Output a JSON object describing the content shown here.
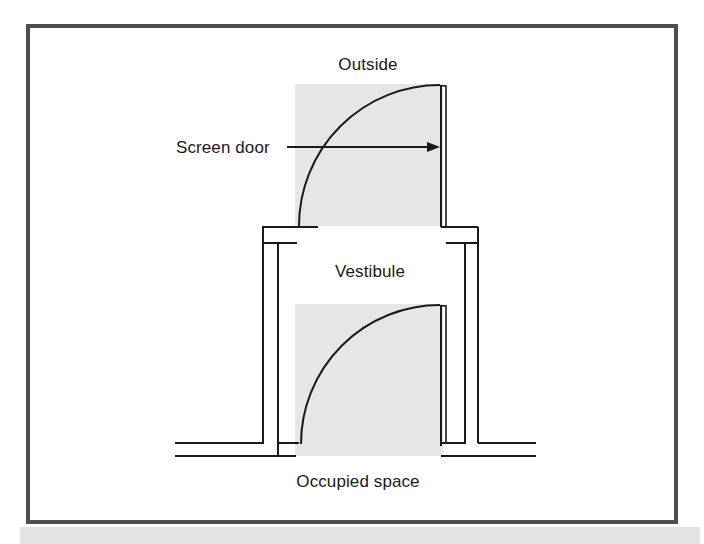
{
  "figure": {
    "type": "architectural-plan",
    "frame": {
      "border_color": "#4d4d4d",
      "border_width_px": 4,
      "x": 26,
      "y": 24,
      "width": 652,
      "height": 500,
      "background": "#ffffff"
    },
    "bottom_band": {
      "color": "#e3e3e3",
      "x": 20,
      "y": 527,
      "width": 680,
      "height": 17
    },
    "colors": {
      "shade_fill": "#e6e6e6",
      "line": "#1a1a1a",
      "text": "#1a1a1a",
      "frame": "#4d4d4d",
      "page": "#ffffff"
    },
    "labels": {
      "outside": "Outside",
      "screen_door": "Screen door",
      "vestibule": "Vestibule",
      "occupied_space": "Occupied space"
    },
    "label_positions": {
      "outside": {
        "x": 368,
        "y": 70,
        "anchor": "middle"
      },
      "screen_door": {
        "x": 176,
        "y": 153,
        "anchor": "start"
      },
      "vestibule": {
        "x": 370,
        "y": 277,
        "anchor": "middle"
      },
      "occupied_space": {
        "x": 358,
        "y": 487,
        "anchor": "middle"
      }
    },
    "annotation": {
      "leader_line": {
        "x1": 287,
        "y1": 147,
        "x2": 437,
        "y2": 147
      },
      "arrowhead": {
        "x": 439,
        "y": 147,
        "size": 9,
        "direction": "right"
      }
    },
    "geometry": {
      "outer_shade_upper": {
        "x": 295,
        "y": 84,
        "width": 148,
        "height": 142
      },
      "outer_shade_lower": {
        "x": 295,
        "y": 304,
        "width": 148,
        "height": 152
      },
      "upper_door_panel": {
        "x": 440,
        "y": 85,
        "width": 6,
        "height": 141
      },
      "lower_door_panel": {
        "x": 440,
        "y": 305,
        "width": 6,
        "height": 139
      },
      "upper_arc": {
        "cx": 440,
        "cy": 226,
        "r": 141,
        "from_deg": 90,
        "to_deg": 180
      },
      "lower_arc": {
        "cx": 440,
        "cy": 444,
        "r": 139,
        "from_deg": 90,
        "to_deg": 180
      },
      "wall_outer_left_x": 262,
      "wall_inner_left_x": 277,
      "wall_inner_right_x": 464,
      "wall_outer_right_x": 478,
      "wall_outer_top_y": 226,
      "wall_inner_top_y": 243,
      "floor_line_upper_y": 443,
      "floor_line_lower_y": 456,
      "floor_left_x": 175,
      "floor_right_x": 536
    }
  }
}
